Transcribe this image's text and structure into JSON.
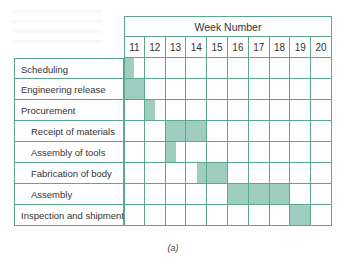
{
  "chart_data": {
    "type": "gantt",
    "title": "Week Number",
    "caption": "(a)",
    "weeks": [
      "11",
      "12",
      "13",
      "14",
      "15",
      "16",
      "17",
      "18",
      "19",
      "20"
    ],
    "tasks": [
      {
        "name": "Scheduling",
        "indent": false,
        "start": 11.0,
        "end": 11.5
      },
      {
        "name": "Engineering release",
        "indent": false,
        "start": 11.0,
        "end": 12.0
      },
      {
        "name": "Procurement",
        "indent": false,
        "start": 12.0,
        "end": 12.5
      },
      {
        "name": "Receipt of materials",
        "indent": true,
        "start": 13.0,
        "end": 15.0
      },
      {
        "name": "Assembly of tools",
        "indent": true,
        "start": 13.0,
        "end": 13.5
      },
      {
        "name": "Fabrication of body",
        "indent": true,
        "start": 14.5,
        "end": 16.0
      },
      {
        "name": "Assembly",
        "indent": true,
        "start": 16.0,
        "end": 19.0
      },
      {
        "name": "Inspection and shipment",
        "indent": false,
        "start": 19.0,
        "end": 20.0
      }
    ],
    "bar_color": "#9fcdbf",
    "grid_color": "#5aa98f"
  }
}
